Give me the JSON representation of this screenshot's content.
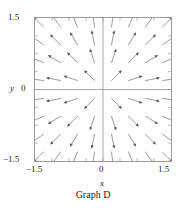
{
  "caption": "Graph D",
  "axes": {
    "x": {
      "name": "x",
      "min": -1.5,
      "max": 1.5,
      "ticks": [
        -1.5,
        0,
        1.5
      ],
      "tick_labels": [
        "−1.5",
        "0",
        "1.5"
      ],
      "minor_tick_count": 7
    },
    "y": {
      "name": "y",
      "min": -1.5,
      "max": 1.5,
      "ticks": [
        -1.5,
        0,
        1.5
      ],
      "tick_labels": [
        "1.5",
        "0",
        "−1.5"
      ],
      "minor_tick_count": 7
    }
  },
  "colors": {
    "frame": "#9a9a9a",
    "axis": "#9a9a9a",
    "tick": "#9a9a9a",
    "arrow": "#555555",
    "text": "#1a1a1a",
    "background": "#ffffff"
  },
  "chart_data": {
    "type": "scatter",
    "subtype": "vector-field",
    "title": "Graph D",
    "xlabel": "x",
    "ylabel": "y",
    "xlim": [
      -1.5,
      1.5
    ],
    "ylim": [
      -1.5,
      1.5
    ],
    "xticks": [
      -1.5,
      0,
      1.5
    ],
    "yticks": [
      -1.5,
      0,
      1.5
    ],
    "grid": false,
    "legend": "none",
    "field_formula": "dx = x, dy = y",
    "grid_x": [
      -1.3125,
      -0.9375,
      -0.5625,
      -0.1875,
      0.1875,
      0.5625,
      0.9375,
      1.3125
    ],
    "grid_y": [
      1.3125,
      0.9375,
      0.5625,
      0.1875,
      -0.1875,
      -0.5625,
      -0.9375,
      -1.3125
    ],
    "arrow_length": 0.33,
    "vectors": [
      {
        "x": -1.3125,
        "y": 1.3125,
        "u": -1.3125,
        "v": 1.3125
      },
      {
        "x": -0.9375,
        "y": 1.3125,
        "u": -0.9375,
        "v": 1.3125
      },
      {
        "x": -0.5625,
        "y": 1.3125,
        "u": -0.5625,
        "v": 1.3125
      },
      {
        "x": -0.1875,
        "y": 1.3125,
        "u": -0.1875,
        "v": 1.3125
      },
      {
        "x": 0.1875,
        "y": 1.3125,
        "u": 0.1875,
        "v": 1.3125
      },
      {
        "x": 0.5625,
        "y": 1.3125,
        "u": 0.5625,
        "v": 1.3125
      },
      {
        "x": 0.9375,
        "y": 1.3125,
        "u": 0.9375,
        "v": 1.3125
      },
      {
        "x": 1.3125,
        "y": 1.3125,
        "u": 1.3125,
        "v": 1.3125
      },
      {
        "x": -1.3125,
        "y": 0.9375,
        "u": -1.3125,
        "v": 0.9375
      },
      {
        "x": -0.9375,
        "y": 0.9375,
        "u": -0.9375,
        "v": 0.9375
      },
      {
        "x": -0.5625,
        "y": 0.9375,
        "u": -0.5625,
        "v": 0.9375
      },
      {
        "x": -0.1875,
        "y": 0.9375,
        "u": -0.1875,
        "v": 0.9375
      },
      {
        "x": 0.1875,
        "y": 0.9375,
        "u": 0.1875,
        "v": 0.9375
      },
      {
        "x": 0.5625,
        "y": 0.9375,
        "u": 0.5625,
        "v": 0.9375
      },
      {
        "x": 0.9375,
        "y": 0.9375,
        "u": 0.9375,
        "v": 0.9375
      },
      {
        "x": 1.3125,
        "y": 0.9375,
        "u": 1.3125,
        "v": 0.9375
      },
      {
        "x": -1.3125,
        "y": 0.5625,
        "u": -1.3125,
        "v": 0.5625
      },
      {
        "x": -0.9375,
        "y": 0.5625,
        "u": -0.9375,
        "v": 0.5625
      },
      {
        "x": -0.5625,
        "y": 0.5625,
        "u": -0.5625,
        "v": 0.5625
      },
      {
        "x": -0.1875,
        "y": 0.5625,
        "u": -0.1875,
        "v": 0.5625
      },
      {
        "x": 0.1875,
        "y": 0.5625,
        "u": 0.1875,
        "v": 0.5625
      },
      {
        "x": 0.5625,
        "y": 0.5625,
        "u": 0.5625,
        "v": 0.5625
      },
      {
        "x": 0.9375,
        "y": 0.5625,
        "u": 0.9375,
        "v": 0.5625
      },
      {
        "x": 1.3125,
        "y": 0.5625,
        "u": 1.3125,
        "v": 0.5625
      },
      {
        "x": -1.3125,
        "y": 0.1875,
        "u": -1.3125,
        "v": 0.1875
      },
      {
        "x": -0.9375,
        "y": 0.1875,
        "u": -0.9375,
        "v": 0.1875
      },
      {
        "x": -0.5625,
        "y": 0.1875,
        "u": -0.5625,
        "v": 0.1875
      },
      {
        "x": -0.1875,
        "y": 0.1875,
        "u": -0.1875,
        "v": 0.1875
      },
      {
        "x": 0.1875,
        "y": 0.1875,
        "u": 0.1875,
        "v": 0.1875
      },
      {
        "x": 0.5625,
        "y": 0.1875,
        "u": 0.5625,
        "v": 0.1875
      },
      {
        "x": 0.9375,
        "y": 0.1875,
        "u": 0.9375,
        "v": 0.1875
      },
      {
        "x": 1.3125,
        "y": 0.1875,
        "u": 1.3125,
        "v": 0.1875
      },
      {
        "x": -1.3125,
        "y": -0.1875,
        "u": -1.3125,
        "v": -0.1875
      },
      {
        "x": -0.9375,
        "y": -0.1875,
        "u": -0.9375,
        "v": -0.1875
      },
      {
        "x": -0.5625,
        "y": -0.1875,
        "u": -0.5625,
        "v": -0.1875
      },
      {
        "x": -0.1875,
        "y": -0.1875,
        "u": -0.1875,
        "v": -0.1875
      },
      {
        "x": 0.1875,
        "y": -0.1875,
        "u": 0.1875,
        "v": -0.1875
      },
      {
        "x": 0.5625,
        "y": -0.1875,
        "u": 0.5625,
        "v": -0.1875
      },
      {
        "x": 0.9375,
        "y": -0.1875,
        "u": 0.9375,
        "v": -0.1875
      },
      {
        "x": 1.3125,
        "y": -0.1875,
        "u": 1.3125,
        "v": -0.1875
      },
      {
        "x": -1.3125,
        "y": -0.5625,
        "u": -1.3125,
        "v": -0.5625
      },
      {
        "x": -0.9375,
        "y": -0.5625,
        "u": -0.9375,
        "v": -0.5625
      },
      {
        "x": -0.5625,
        "y": -0.5625,
        "u": -0.5625,
        "v": -0.5625
      },
      {
        "x": -0.1875,
        "y": -0.5625,
        "u": -0.1875,
        "v": -0.5625
      },
      {
        "x": 0.1875,
        "y": -0.5625,
        "u": 0.1875,
        "v": -0.5625
      },
      {
        "x": 0.5625,
        "y": -0.5625,
        "u": 0.5625,
        "v": -0.5625
      },
      {
        "x": 0.9375,
        "y": -0.5625,
        "u": 0.9375,
        "v": -0.5625
      },
      {
        "x": 1.3125,
        "y": -0.5625,
        "u": 1.3125,
        "v": -0.5625
      },
      {
        "x": -1.3125,
        "y": -0.9375,
        "u": -1.3125,
        "v": -0.9375
      },
      {
        "x": -0.9375,
        "y": -0.9375,
        "u": -0.9375,
        "v": -0.9375
      },
      {
        "x": -0.5625,
        "y": -0.9375,
        "u": -0.5625,
        "v": -0.9375
      },
      {
        "x": -0.1875,
        "y": -0.9375,
        "u": -0.1875,
        "v": -0.9375
      },
      {
        "x": 0.1875,
        "y": -0.9375,
        "u": 0.1875,
        "v": -0.9375
      },
      {
        "x": 0.5625,
        "y": -0.9375,
        "u": 0.5625,
        "v": -0.9375
      },
      {
        "x": 0.9375,
        "y": -0.9375,
        "u": 0.9375,
        "v": -0.9375
      },
      {
        "x": 1.3125,
        "y": -0.9375,
        "u": 1.3125,
        "v": -0.9375
      },
      {
        "x": -1.3125,
        "y": -1.3125,
        "u": -1.3125,
        "v": -1.3125
      },
      {
        "x": -0.9375,
        "y": -1.3125,
        "u": -0.9375,
        "v": -1.3125
      },
      {
        "x": -0.5625,
        "y": -1.3125,
        "u": -0.5625,
        "v": -1.3125
      },
      {
        "x": -0.1875,
        "y": -1.3125,
        "u": -0.1875,
        "v": -1.3125
      },
      {
        "x": 0.1875,
        "y": -1.3125,
        "u": 0.1875,
        "v": -1.3125
      },
      {
        "x": 0.5625,
        "y": -1.3125,
        "u": 0.5625,
        "v": -1.3125
      },
      {
        "x": 0.9375,
        "y": -1.3125,
        "u": 0.9375,
        "v": -1.3125
      },
      {
        "x": 1.3125,
        "y": -1.3125,
        "u": 1.3125,
        "v": -1.3125
      }
    ]
  }
}
